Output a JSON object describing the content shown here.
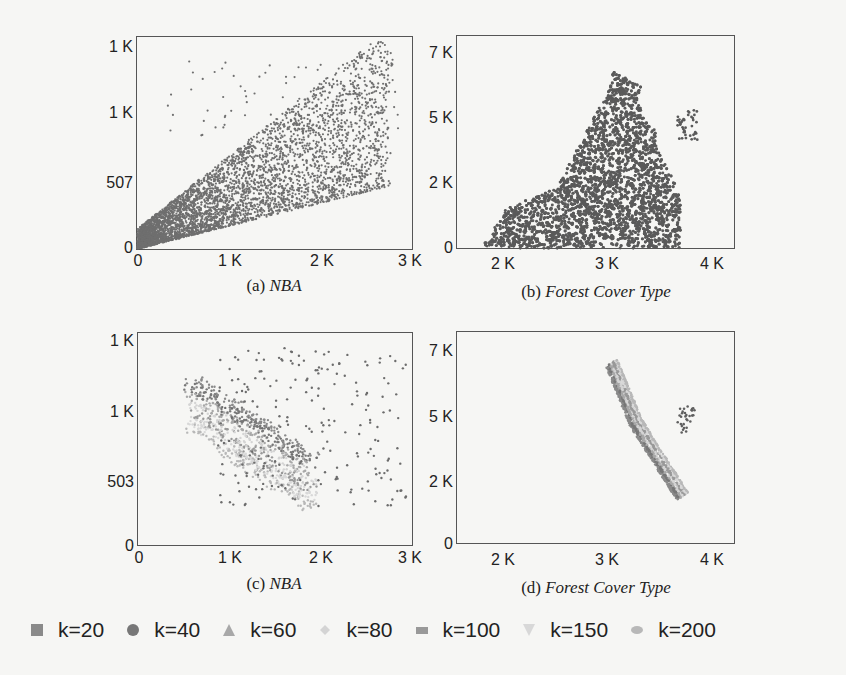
{
  "chart_data": [
    {
      "id": "a",
      "type": "scatter",
      "caption_prefix": "(a) ",
      "caption_title": "NBA",
      "xlabel": "",
      "ylabel": "",
      "x_ticks": [
        "0",
        "1 K",
        "2 K",
        "3 K"
      ],
      "y_ticks": [
        "0",
        "507",
        "1 K",
        "1 K"
      ],
      "xlim": [
        0,
        3000
      ],
      "ylim": [
        0,
        1300
      ],
      "grid": false,
      "description": "Dense cloud of gray points concentrated near origin, fanning out up to ~2.8K on x and ~1.25K on y; all points same color (full dataset)."
    },
    {
      "id": "b",
      "type": "scatter",
      "caption_prefix": "(b) ",
      "caption_title": "Forest Cover Type",
      "x_ticks": [
        "2 K",
        "3 K",
        "4 K"
      ],
      "y_ticks": [
        "0",
        "2 K",
        "5 K",
        "7 K"
      ],
      "xlim": [
        1750,
        4100
      ],
      "ylim": [
        0,
        7500
      ],
      "grid": false,
      "description": "Solid dark gray mountain-shaped mass from ~1.85K to ~3.7K on x, peaking ~6.8K near x≈3.05K, with small separate cluster near x≈3.7K, y≈4.5-5.2K."
    },
    {
      "id": "c",
      "type": "scatter",
      "caption_prefix": "(c) ",
      "caption_title": "NBA",
      "x_ticks": [
        "0",
        "1 K",
        "2 K",
        "3 K"
      ],
      "y_ticks": [
        "0",
        "503",
        "1 K",
        "1 K"
      ],
      "xlim": [
        0,
        3000
      ],
      "ylim": [
        0,
        1300
      ],
      "grid": false,
      "description": "Skyline layers for k=20..200: dark points (low k) in upper right, lighter bands (high k) forming diagonal band from (0.6K,800) down to (1.7K,300)."
    },
    {
      "id": "d",
      "type": "scatter",
      "caption_prefix": "(d) ",
      "caption_title": "Forest Cover Type",
      "x_ticks": [
        "2 K",
        "3 K",
        "4 K"
      ],
      "y_ticks": [
        "0",
        "2 K",
        "5 K",
        "7 K"
      ],
      "xlim": [
        1750,
        4100
      ],
      "ylim": [
        0,
        7500
      ],
      "grid": false,
      "description": "Thin layered boundary band of the skyline, from (3.05K,6.7K) curving down to (3.5K,1.2K), dark on top/outer edge and lighter inside; small cluster near (3.7K,4.8K)."
    }
  ],
  "legend": {
    "items": [
      {
        "label": "k=20",
        "shape": "square",
        "color": "#8a8a8a"
      },
      {
        "label": "k=40",
        "shape": "circle",
        "color": "#777777"
      },
      {
        "label": "k=60",
        "shape": "triangle-up",
        "color": "#a8a8a8"
      },
      {
        "label": "k=80",
        "shape": "diamond",
        "color": "#d4d4d4"
      },
      {
        "label": "k=100",
        "shape": "rect",
        "color": "#999999"
      },
      {
        "label": "k=150",
        "shape": "triangle-down",
        "color": "#d8d8d8"
      },
      {
        "label": "k=200",
        "shape": "ellipse",
        "color": "#b8b8b8"
      }
    ]
  }
}
